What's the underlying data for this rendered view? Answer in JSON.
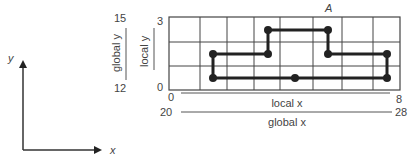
{
  "figure": {
    "label_A": "A",
    "colors": {
      "ink": "#222222",
      "grid": "#444444",
      "text": "#444444"
    }
  },
  "reference_axes": {
    "x_label": "x",
    "y_label": "y"
  },
  "y_axes": {
    "global": {
      "label": "global y",
      "min": "12",
      "max": "15"
    },
    "local": {
      "label": "local y",
      "min": "0",
      "max": "3"
    }
  },
  "x_axes": {
    "local": {
      "label": "local x",
      "min": "0",
      "max": "8"
    },
    "global": {
      "label": "global x",
      "min": "20",
      "max": "28"
    }
  },
  "grid": {
    "columns": 8,
    "rows": 3
  },
  "path_points_local": [
    [
      1.5,
      1.5
    ],
    [
      3.5,
      1.5
    ],
    [
      3.5,
      2.5
    ],
    [
      5.5,
      2.5
    ],
    [
      5.5,
      1.5
    ],
    [
      7.5,
      1.5
    ],
    [
      7.5,
      0.5
    ],
    [
      4.5,
      0.5
    ],
    [
      1.5,
      0.5
    ],
    [
      1.5,
      1.5
    ]
  ]
}
